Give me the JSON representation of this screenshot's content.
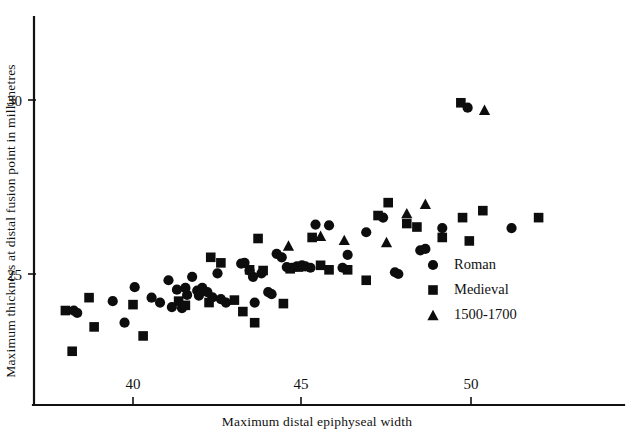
{
  "chart_data": {
    "type": "scatter",
    "title": "",
    "xlabel": "Maximum distal epiphyseal width",
    "ylabel": "Maximum thickness at distal fusion point in millimetres",
    "xlim": [
      37.6,
      52.6
    ],
    "ylim": [
      22.6,
      31.2
    ],
    "xticks": [
      40,
      45,
      50
    ],
    "yticks": [
      25,
      30
    ],
    "xtick_labels": [
      "40",
      "45",
      "50"
    ],
    "ytick_labels": [
      "25",
      "30"
    ],
    "grid": false,
    "legend_position": "center-right",
    "series": [
      {
        "name": "Roman",
        "marker": "circle",
        "color": "#0d0d0d",
        "points": [
          [
            38.25,
            23.95
          ],
          [
            38.35,
            23.88
          ],
          [
            39.4,
            24.22
          ],
          [
            39.75,
            23.6
          ],
          [
            40.05,
            24.62
          ],
          [
            40.55,
            24.32
          ],
          [
            40.8,
            24.18
          ],
          [
            41.05,
            24.82
          ],
          [
            41.15,
            24.05
          ],
          [
            41.3,
            24.55
          ],
          [
            41.45,
            24.02
          ],
          [
            41.55,
            24.6
          ],
          [
            41.6,
            24.4
          ],
          [
            41.75,
            24.92
          ],
          [
            41.9,
            24.52
          ],
          [
            41.95,
            24.38
          ],
          [
            42.05,
            24.6
          ],
          [
            42.2,
            24.48
          ],
          [
            42.35,
            24.33
          ],
          [
            42.5,
            25.02
          ],
          [
            42.6,
            24.28
          ],
          [
            42.75,
            24.18
          ],
          [
            43.2,
            25.3
          ],
          [
            43.3,
            25.32
          ],
          [
            43.45,
            25.1
          ],
          [
            43.55,
            24.92
          ],
          [
            43.6,
            24.18
          ],
          [
            43.8,
            25.02
          ],
          [
            44.0,
            24.48
          ],
          [
            44.1,
            24.42
          ],
          [
            44.25,
            25.58
          ],
          [
            44.4,
            25.48
          ],
          [
            44.55,
            25.2
          ],
          [
            44.7,
            25.18
          ],
          [
            44.85,
            25.22
          ],
          [
            45.0,
            25.25
          ],
          [
            45.1,
            25.22
          ],
          [
            45.25,
            25.18
          ],
          [
            45.4,
            26.42
          ],
          [
            45.8,
            26.4
          ],
          [
            46.2,
            25.18
          ],
          [
            46.35,
            25.55
          ],
          [
            46.9,
            26.2
          ],
          [
            47.4,
            26.62
          ],
          [
            47.75,
            25.05
          ],
          [
            47.85,
            25.0
          ],
          [
            48.5,
            25.68
          ],
          [
            48.65,
            25.72
          ],
          [
            49.15,
            26.32
          ],
          [
            49.9,
            29.78
          ],
          [
            51.2,
            26.32
          ]
        ]
      },
      {
        "name": "Medieval",
        "marker": "square",
        "color": "#0d0d0d",
        "points": [
          [
            38.0,
            23.95
          ],
          [
            38.2,
            22.78
          ],
          [
            38.7,
            24.32
          ],
          [
            38.85,
            23.48
          ],
          [
            40.0,
            24.12
          ],
          [
            40.3,
            23.22
          ],
          [
            41.35,
            24.22
          ],
          [
            41.55,
            24.1
          ],
          [
            42.25,
            24.18
          ],
          [
            42.3,
            25.48
          ],
          [
            42.6,
            25.32
          ],
          [
            43.0,
            24.25
          ],
          [
            43.25,
            23.92
          ],
          [
            43.45,
            25.12
          ],
          [
            43.6,
            23.6
          ],
          [
            43.7,
            26.02
          ],
          [
            43.85,
            25.1
          ],
          [
            44.45,
            24.15
          ],
          [
            44.65,
            25.15
          ],
          [
            44.9,
            25.2
          ],
          [
            45.3,
            26.05
          ],
          [
            45.55,
            25.25
          ],
          [
            45.8,
            25.12
          ],
          [
            46.35,
            25.12
          ],
          [
            46.9,
            24.82
          ],
          [
            47.25,
            26.68
          ],
          [
            47.55,
            27.05
          ],
          [
            48.1,
            26.45
          ],
          [
            48.4,
            26.35
          ],
          [
            49.15,
            26.05
          ],
          [
            49.7,
            29.92
          ],
          [
            49.75,
            26.62
          ],
          [
            49.95,
            25.95
          ],
          [
            50.35,
            26.82
          ],
          [
            52.0,
            26.62
          ]
        ]
      },
      {
        "name": "1500-1700",
        "marker": "triangle",
        "color": "#0d0d0d",
        "points": [
          [
            44.6,
            25.82
          ],
          [
            45.55,
            26.1
          ],
          [
            46.25,
            25.98
          ],
          [
            47.5,
            25.92
          ],
          [
            48.1,
            26.75
          ],
          [
            48.65,
            27.02
          ],
          [
            50.4,
            29.72
          ]
        ]
      }
    ]
  },
  "axes": {
    "x_title": "Maximum distal epiphyseal width",
    "y_title": "Maximum thickness at distal fusion point in millimetres",
    "x_tick_40": "40",
    "x_tick_45": "45",
    "x_tick_50": "50",
    "y_tick_25": "25",
    "y_tick_30": "30"
  },
  "legend": {
    "items": [
      {
        "label": "Roman",
        "marker": "circle-marker-icon"
      },
      {
        "label": "Medieval",
        "marker": "square-marker-icon"
      },
      {
        "label": "1500-1700",
        "marker": "triangle-marker-icon"
      }
    ]
  }
}
